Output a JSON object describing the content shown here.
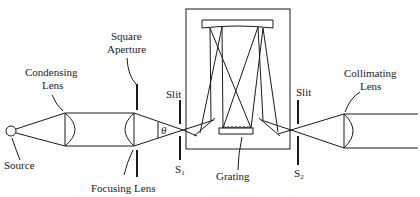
{
  "diagram": {
    "labels": {
      "source": "Source",
      "condensing_lens_1": "Condensing",
      "condensing_lens_2": "Lens",
      "square_aperture_1": "Square",
      "square_aperture_2": "Aperture",
      "focusing_lens": "Focusing Lens",
      "slit1": "Slit",
      "s1_main": "S",
      "s1_sub": "1",
      "theta": "θ",
      "grating": "Grating",
      "slit2": "Slit",
      "s2_main": "S",
      "s2_sub": "2",
      "collimating_lens_1": "Collimating",
      "collimating_lens_2": "Lens"
    },
    "stroke_color": "#1a1a1a",
    "background": "#ffffff"
  }
}
